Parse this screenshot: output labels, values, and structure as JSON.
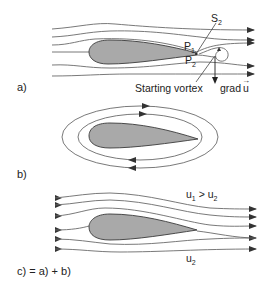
{
  "figure": {
    "colors": {
      "airfoil_fill": "#a9a9a9",
      "airfoil_stroke": "#3a3a3a",
      "streamline": "#6a6a6a",
      "arrow": "#333333",
      "text": "#222222"
    },
    "panel_a": {
      "label": "a)",
      "point_s2": {
        "main": "S",
        "sub": "2"
      },
      "point_p1": {
        "main": "P",
        "sub": "1"
      },
      "point_p2": {
        "main": "P",
        "sub": "2"
      },
      "starting_vortex_label": "Starting vortex",
      "grad_label": "grad",
      "grad_vector": "u",
      "grad_arrow": "→"
    },
    "panel_b": {
      "label": "b)",
      "description": "circulation around airfoil"
    },
    "panel_c": {
      "label": "c) = a) + b)",
      "upper_velocity": {
        "u1_main": "u",
        "u1_sub": "1",
        "relation": " > ",
        "u2_main": "u",
        "u2_sub": "2"
      },
      "lower_velocity": {
        "main": "u",
        "sub": "2"
      }
    }
  }
}
